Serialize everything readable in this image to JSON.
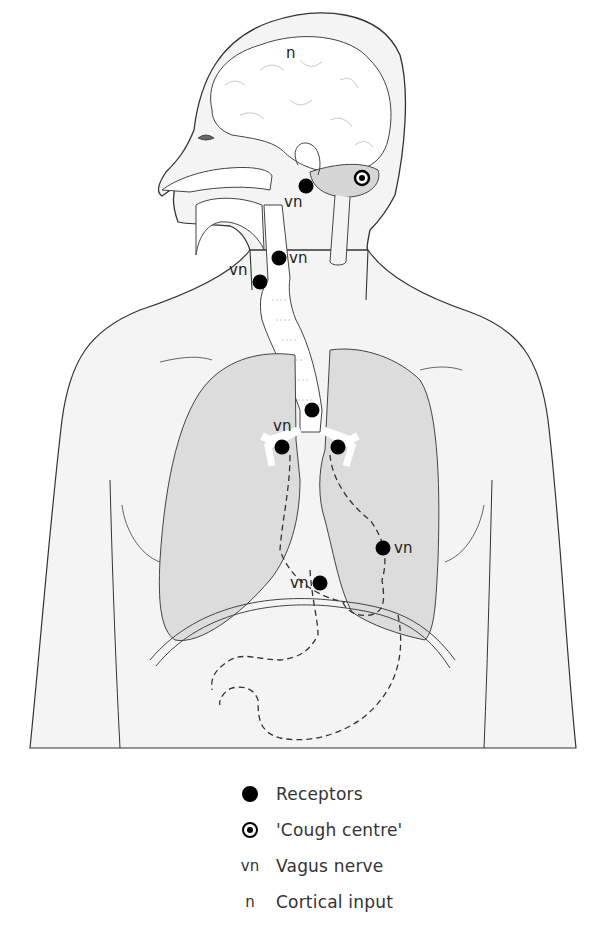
{
  "figure": {
    "labels": {
      "cortical": "n",
      "vagus": "vn"
    },
    "colors": {
      "body_fill": "#f4f4f4",
      "lung_fill": "#dcdcdc",
      "cerebellum_fill": "#d6d6d6",
      "outline": "#333333",
      "receptor": "#000000"
    },
    "receptors": [
      {
        "x": 306,
        "y": 186,
        "label": "vn"
      },
      {
        "x": 279,
        "y": 258,
        "label": "vn"
      },
      {
        "x": 260,
        "y": 282,
        "label": "vn"
      },
      {
        "x": 312,
        "y": 410,
        "label": ""
      },
      {
        "x": 282,
        "y": 447,
        "label": "vn"
      },
      {
        "x": 338,
        "y": 447,
        "label": ""
      },
      {
        "x": 383,
        "y": 548,
        "label": "vn"
      },
      {
        "x": 320,
        "y": 583,
        "label": "vn"
      }
    ],
    "cough_centre": {
      "x": 362,
      "y": 178
    }
  },
  "legend": {
    "items": [
      {
        "symbol": "receptor-dot",
        "text": "Receptors"
      },
      {
        "symbol": "cough-centre-target",
        "text": "'Cough centre'"
      },
      {
        "symbol": "vn",
        "text": "Vagus nerve"
      },
      {
        "symbol": "n",
        "text": "Cortical input"
      }
    ]
  }
}
